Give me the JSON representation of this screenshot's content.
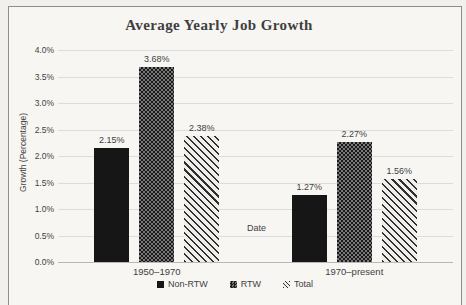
{
  "chart_data": {
    "type": "bar",
    "title": "Average Yearly Job Growth",
    "xlabel": "Date",
    "ylabel": "Growth (Percentage)",
    "categories": [
      "1950–1970",
      "1970–present"
    ],
    "series": [
      {
        "name": "Non-RTW",
        "pattern": "solid",
        "values": [
          2.15,
          1.27
        ],
        "labels": [
          "2.15%",
          "1.27%"
        ]
      },
      {
        "name": "RTW",
        "pattern": "checker",
        "values": [
          3.68,
          2.27
        ],
        "labels": [
          "3.68%",
          "2.27%"
        ]
      },
      {
        "name": "Total",
        "pattern": "diagonal",
        "values": [
          2.38,
          1.56
        ],
        "labels": [
          "2.38%",
          "1.56%"
        ]
      }
    ],
    "y_ticks": [
      "4.0%",
      "3.5%",
      "3.0%",
      "2.5%",
      "2.0%",
      "1.5%",
      "1.0%",
      "0.5%",
      "0.0%"
    ],
    "ylim": [
      0,
      4.0
    ],
    "y_step": 0.5,
    "grid": true,
    "legend_position": "bottom"
  },
  "colors": {
    "page_bg": "#f1f0ec",
    "chart_bg": "#f7f6f3",
    "frame_border": "#8e8d8a",
    "gridline": "#dddcd8",
    "axis_line": "#b9b8b4",
    "text": "#3f3f3f",
    "bar_solid": "#161616",
    "pattern_dark": "#1a1a1a",
    "pattern_mid": "#787878",
    "stripe_dark": "#2f2f2f",
    "stripe_light": "#efeeea"
  }
}
